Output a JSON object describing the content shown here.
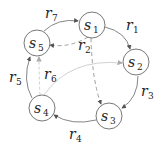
{
  "diagram": {
    "nodes": [
      {
        "id": "s1",
        "base": "s",
        "sub": "1",
        "cx": 92,
        "cy": 25
      },
      {
        "id": "s2",
        "base": "s",
        "sub": "2",
        "cx": 136,
        "cy": 62
      },
      {
        "id": "s3",
        "base": "s",
        "sub": "3",
        "cx": 109,
        "cy": 116
      },
      {
        "id": "s4",
        "base": "s",
        "sub": "4",
        "cx": 42,
        "cy": 108
      },
      {
        "id": "s5",
        "base": "s",
        "sub": "5",
        "cx": 37,
        "cy": 43
      }
    ],
    "edges": [
      {
        "id": "r1",
        "base": "r",
        "sub": "1",
        "from": "s1",
        "to": "s2",
        "style": "solid"
      },
      {
        "id": "r2",
        "base": "r",
        "sub": "2",
        "from": "s1",
        "to": "s5",
        "style": "dashed"
      },
      {
        "id": "r2b",
        "base": "r",
        "sub": "2",
        "from": "s1",
        "to": "s3",
        "style": "dashed"
      },
      {
        "id": "r3",
        "base": "r",
        "sub": "3",
        "from": "s2",
        "to": "s3",
        "style": "solid"
      },
      {
        "id": "r4",
        "base": "r",
        "sub": "4",
        "from": "s3",
        "to": "s4",
        "style": "solid"
      },
      {
        "id": "r5",
        "base": "r",
        "sub": "5",
        "from": "s4",
        "to": "s5",
        "style": "solid"
      },
      {
        "id": "r6",
        "base": "r",
        "sub": "6",
        "from": "s4",
        "to": "s2",
        "style": "light"
      },
      {
        "id": "r6b",
        "base": "r",
        "sub": "6",
        "from": "s4",
        "to": "s5",
        "style": "light-dashed"
      },
      {
        "id": "r7",
        "base": "r",
        "sub": "7",
        "from": "s5",
        "to": "s1",
        "style": "solid"
      }
    ],
    "labels": {
      "s": "s",
      "r": "r",
      "n1": "1",
      "n2": "2",
      "n3": "3",
      "n4": "4",
      "n5": "5",
      "n6": "6",
      "n7": "7"
    }
  }
}
